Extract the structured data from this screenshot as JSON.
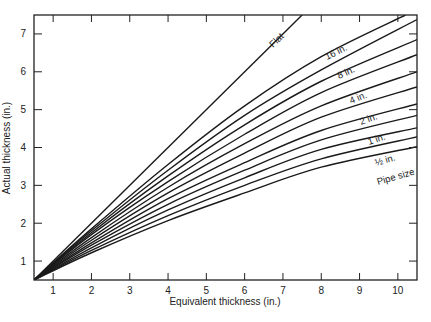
{
  "chart_data": {
    "type": "line",
    "title": "",
    "xlabel": "Equivalent thickness (in.)",
    "ylabel": "Actual thickness (in.)",
    "xlim": [
      0.5,
      10.5
    ],
    "ylim": [
      0.5,
      7.5
    ],
    "xticks": [
      1,
      2,
      3,
      4,
      5,
      6,
      7,
      8,
      9,
      10
    ],
    "yticks": [
      1,
      2,
      3,
      4,
      5,
      6,
      7
    ],
    "grid": false,
    "legend": "inline labels on curves",
    "annotations": [
      "Flat",
      "16 in.",
      "8 in.",
      "4 in.",
      "2 in.",
      "1 in.",
      "½ in.",
      "Pipe size"
    ],
    "series": [
      {
        "name": "Flat",
        "x": [
          0.5,
          7.5
        ],
        "y": [
          0.5,
          7.5
        ]
      },
      {
        "name": "16 in.",
        "x": [
          0.5,
          2,
          4,
          6,
          8,
          10.2
        ],
        "y": [
          0.5,
          1.85,
          3.55,
          5.1,
          6.4,
          7.5
        ]
      },
      {
        "name": "curve 2",
        "x": [
          0.5,
          2,
          4,
          6,
          8,
          10.5
        ],
        "y": [
          0.5,
          1.8,
          3.4,
          4.85,
          6.05,
          7.38
        ]
      },
      {
        "name": "8 in.",
        "x": [
          0.5,
          2,
          4,
          6,
          8,
          10.5
        ],
        "y": [
          0.5,
          1.75,
          3.25,
          4.6,
          5.75,
          6.85
        ]
      },
      {
        "name": "curve 4",
        "x": [
          0.5,
          2,
          4,
          6,
          8,
          10.5
        ],
        "y": [
          0.5,
          1.7,
          3.1,
          4.35,
          5.45,
          6.45
        ]
      },
      {
        "name": "4 in.",
        "x": [
          0.5,
          2,
          4,
          6,
          8,
          10.5
        ],
        "y": [
          0.5,
          1.62,
          2.95,
          4.1,
          5.1,
          6.0
        ]
      },
      {
        "name": "curve 6",
        "x": [
          0.5,
          2,
          4,
          6,
          8,
          10.5
        ],
        "y": [
          0.5,
          1.55,
          2.8,
          3.85,
          4.8,
          5.6
        ]
      },
      {
        "name": "2 in.",
        "x": [
          0.5,
          2,
          4,
          6,
          8,
          10.5
        ],
        "y": [
          0.5,
          1.48,
          2.65,
          3.6,
          4.45,
          5.15
        ]
      },
      {
        "name": "curve 8",
        "x": [
          0.5,
          2,
          4,
          6,
          8,
          10.5
        ],
        "y": [
          0.5,
          1.42,
          2.5,
          3.4,
          4.2,
          4.85
        ]
      },
      {
        "name": "1 in.",
        "x": [
          0.5,
          2,
          4,
          6,
          8,
          10.5
        ],
        "y": [
          0.5,
          1.35,
          2.35,
          3.2,
          3.95,
          4.52
        ]
      },
      {
        "name": "curve 10",
        "x": [
          0.5,
          2,
          4,
          6,
          8,
          10.5
        ],
        "y": [
          0.5,
          1.28,
          2.2,
          3.0,
          3.7,
          4.28
        ]
      },
      {
        "name": "½ in.",
        "x": [
          0.5,
          2,
          4,
          6,
          8,
          10.5
        ],
        "y": [
          0.5,
          1.22,
          2.07,
          2.8,
          3.48,
          4.02
        ]
      }
    ]
  },
  "labels": {
    "xlabel": "Equivalent thickness (in.)",
    "ylabel": "Actual thickness (in.)",
    "flat": "Flat",
    "p16": "16 in.",
    "p8": "8 in.",
    "p4": "4 in.",
    "p2": "2 in.",
    "p1": "1 in.",
    "phalf": "½ in.",
    "pipe_size": "Pipe size"
  }
}
